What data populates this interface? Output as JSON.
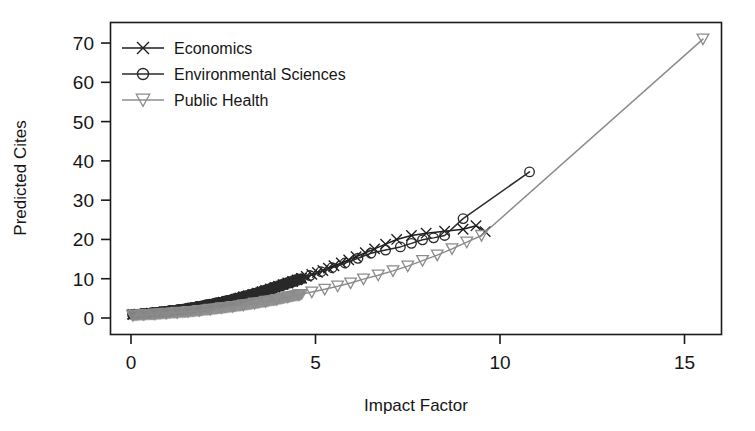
{
  "chart_data": {
    "type": "line",
    "title": "",
    "xlabel": "Impact Factor",
    "ylabel": "Predicted Cites",
    "xlim": [
      -0.6,
      15.9
    ],
    "ylim": [
      -1.5,
      74
    ],
    "xticks": [
      0,
      5,
      10,
      15
    ],
    "xtick_labels": [
      "0",
      "5",
      "10",
      "15"
    ],
    "yticks": [
      0,
      10,
      20,
      30,
      40,
      50,
      60,
      70
    ],
    "ytick_labels": [
      "0",
      "10",
      "20",
      "30",
      "40",
      "50",
      "60",
      "70"
    ],
    "grid": false,
    "frame": "box",
    "legend_position": "top-left",
    "legend_entries": [
      "Economics",
      "Environmental Sciences",
      "Public Health"
    ],
    "series": [
      {
        "name": "Economics",
        "marker": "x",
        "color": "#1c1c1c",
        "x": [
          0.05,
          0.22,
          0.38,
          0.55,
          0.72,
          0.9,
          1.05,
          1.2,
          1.35,
          1.5,
          1.62,
          1.75,
          1.88,
          2.0,
          2.12,
          2.25,
          2.38,
          2.5,
          2.6,
          2.72,
          2.85,
          2.95,
          3.05,
          3.18,
          3.3,
          3.42,
          3.55,
          3.65,
          3.78,
          3.9,
          4.0,
          4.12,
          4.25,
          4.38,
          4.5,
          4.62,
          4.75,
          4.9,
          5.05,
          5.2,
          5.35,
          5.5,
          5.7,
          5.9,
          6.1,
          6.35,
          6.6,
          6.9,
          7.2,
          7.6,
          8.0,
          8.5,
          9.0,
          9.35,
          9.6
        ],
        "y": [
          0.9,
          1.0,
          1.1,
          1.25,
          1.4,
          1.55,
          1.7,
          1.85,
          2.0,
          2.2,
          2.4,
          2.6,
          2.8,
          3.0,
          3.25,
          3.5,
          3.75,
          4.0,
          4.25,
          4.5,
          4.8,
          5.1,
          5.4,
          5.7,
          6.0,
          6.3,
          6.7,
          7.0,
          7.4,
          7.8,
          8.1,
          8.5,
          8.9,
          9.3,
          9.7,
          10.1,
          10.6,
          11.1,
          11.6,
          12.1,
          12.7,
          13.3,
          14.0,
          14.8,
          15.6,
          16.6,
          17.6,
          18.8,
          20.0,
          21.0,
          21.6,
          22.1,
          22.6,
          23.5,
          22.0
        ]
      },
      {
        "name": "Environmental Sciences",
        "marker": "o",
        "color": "#2a2a2a",
        "x": [
          0.05,
          0.3,
          0.55,
          0.8,
          1.05,
          1.3,
          1.55,
          1.8,
          2.05,
          2.3,
          2.55,
          2.8,
          3.05,
          3.3,
          3.55,
          3.8,
          4.05,
          4.3,
          4.55,
          4.85,
          5.15,
          5.45,
          5.8,
          6.15,
          6.5,
          6.9,
          7.3,
          7.6,
          7.9,
          8.2,
          8.5,
          9.0,
          10.8
        ],
        "y": [
          0.9,
          1.1,
          1.35,
          1.6,
          1.9,
          2.2,
          2.55,
          2.95,
          3.4,
          3.85,
          4.35,
          4.9,
          5.5,
          6.1,
          6.8,
          7.5,
          8.2,
          9.0,
          9.9,
          10.8,
          11.8,
          12.8,
          14.0,
          15.2,
          16.5,
          17.3,
          18.1,
          19.0,
          19.9,
          20.4,
          21.0,
          25.3,
          37.2
        ]
      },
      {
        "name": "Public Health",
        "marker": "v",
        "color": "#8c8c8c",
        "x": [
          0.05,
          0.35,
          0.65,
          0.95,
          1.25,
          1.55,
          1.85,
          2.15,
          2.45,
          2.75,
          3.05,
          3.35,
          3.65,
          3.95,
          4.25,
          4.55,
          4.9,
          5.25,
          5.6,
          5.95,
          6.3,
          6.7,
          7.1,
          7.5,
          7.9,
          8.3,
          8.7,
          9.1,
          9.5,
          15.5
        ],
        "y": [
          0.7,
          0.85,
          1.0,
          1.2,
          1.4,
          1.6,
          1.9,
          2.2,
          2.55,
          2.9,
          3.3,
          3.75,
          4.2,
          4.7,
          5.3,
          5.9,
          6.6,
          7.3,
          8.1,
          8.9,
          9.9,
          10.9,
          12.0,
          13.2,
          14.6,
          16.0,
          17.6,
          19.3,
          21.0,
          71.0
        ]
      }
    ]
  },
  "axis": {
    "xlabel": "Impact Factor",
    "ylabel": "Predicted Cites"
  }
}
